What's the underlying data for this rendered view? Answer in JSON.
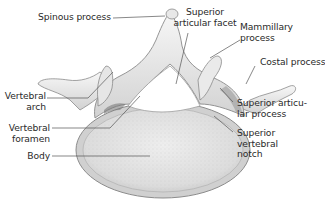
{
  "figure": {
    "colors": {
      "bone_light": "#f2f2f2",
      "bone_mid": "#d6d6d6",
      "bone_dark": "#8a8a8a",
      "line": "#555555",
      "text": "#2a2a2a"
    }
  },
  "labels": {
    "spinous_process": "Spinous process",
    "superior_articular_facet": [
      "Superior",
      "articular facet"
    ],
    "mammillary_process": [
      "Mammillary",
      "process"
    ],
    "costal_process": "Costal process",
    "vertebral_arch": [
      "Vertebral",
      "arch"
    ],
    "superior_articular_process": [
      "Superior articu-",
      "lar process"
    ],
    "vertebral_foramen": [
      "Vertebral",
      "foramen"
    ],
    "superior_vertebral_notch": [
      "Superior",
      "vertebral",
      "notch"
    ],
    "body": "Body"
  }
}
